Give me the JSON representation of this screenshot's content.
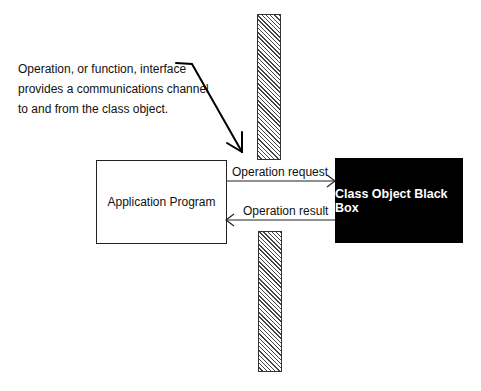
{
  "annotation": {
    "lines": [
      "Operation, or function, interface",
      "provides a communications channel",
      "to and from  the class object."
    ]
  },
  "nodes": {
    "application_program": {
      "label": "Application Program",
      "fill": "#ffffff"
    },
    "class_object": {
      "label": "Class Object Black Box",
      "fill": "#000000",
      "text_color": "#ffffff"
    }
  },
  "edges": {
    "request": {
      "label": "Operation request",
      "from": "Application Program",
      "to": "Class Object Black Box"
    },
    "result": {
      "label": "Operation result",
      "from": "Class Object Black Box",
      "to": "Application Program"
    }
  },
  "interface_barrier": {
    "segments": 2,
    "pattern": "diagonal-hatch"
  }
}
